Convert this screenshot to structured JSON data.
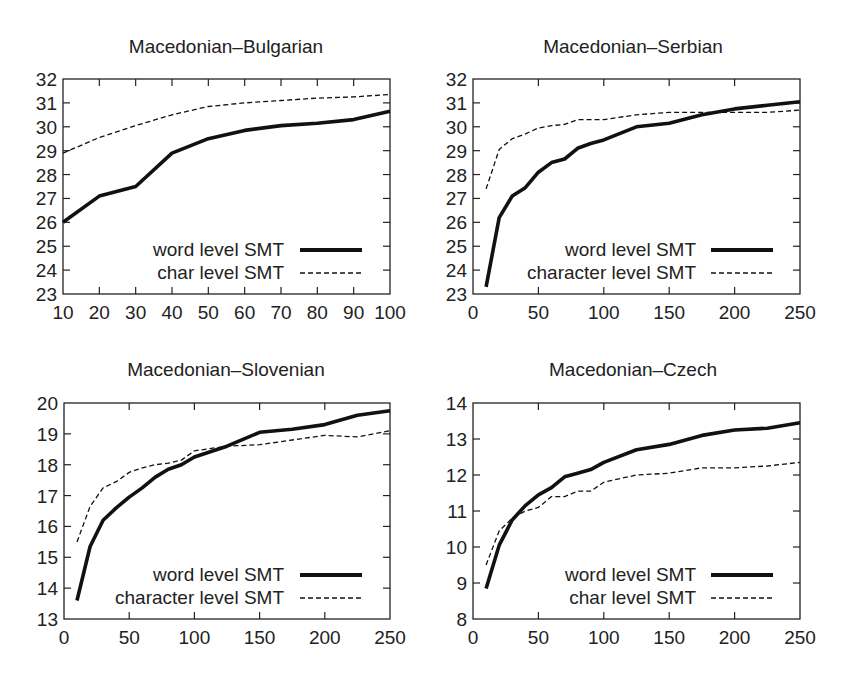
{
  "chart_data": [
    {
      "type": "line",
      "title": "Macedonian–Bulgarian",
      "xlabel": "",
      "ylabel": "",
      "xlim": [
        10,
        100
      ],
      "ylim": [
        23,
        32
      ],
      "xticks": [
        10,
        20,
        30,
        40,
        50,
        60,
        70,
        80,
        90,
        100
      ],
      "yticks": [
        23,
        24,
        25,
        26,
        27,
        28,
        29,
        30,
        31,
        32
      ],
      "grid": false,
      "legend_position": "lower right",
      "series": [
        {
          "name": "word level SMT",
          "style": "solid-thick",
          "x": [
            10,
            20,
            30,
            40,
            50,
            60,
            70,
            80,
            90,
            100
          ],
          "values": [
            26.0,
            27.1,
            27.5,
            28.9,
            29.5,
            29.85,
            30.05,
            30.15,
            30.3,
            30.65
          ]
        },
        {
          "name": "char level SMT",
          "style": "dashed",
          "x": [
            10,
            20,
            30,
            40,
            50,
            60,
            70,
            80,
            90,
            100
          ],
          "values": [
            28.9,
            29.55,
            30.05,
            30.5,
            30.85,
            31.0,
            31.1,
            31.2,
            31.25,
            31.35
          ]
        }
      ]
    },
    {
      "type": "line",
      "title": "Macedonian–Serbian",
      "xlabel": "",
      "ylabel": "",
      "xlim": [
        0,
        250
      ],
      "ylim": [
        23,
        32
      ],
      "xticks": [
        0,
        50,
        100,
        150,
        200,
        250
      ],
      "yticks": [
        23,
        24,
        25,
        26,
        27,
        28,
        29,
        30,
        31,
        32
      ],
      "grid": false,
      "legend_position": "lower right",
      "series": [
        {
          "name": "word level SMT",
          "style": "solid-thick",
          "x": [
            10,
            20,
            30,
            40,
            50,
            60,
            70,
            80,
            90,
            100,
            125,
            150,
            175,
            200,
            225,
            250
          ],
          "values": [
            23.3,
            26.2,
            27.1,
            27.45,
            28.1,
            28.5,
            28.65,
            29.1,
            29.3,
            29.45,
            30.0,
            30.15,
            30.5,
            30.75,
            30.9,
            31.05
          ]
        },
        {
          "name": "character level SMT",
          "style": "dashed",
          "x": [
            10,
            20,
            30,
            40,
            50,
            60,
            70,
            80,
            90,
            100,
            125,
            150,
            175,
            200,
            225,
            250
          ],
          "values": [
            27.4,
            29.05,
            29.5,
            29.7,
            29.95,
            30.05,
            30.1,
            30.3,
            30.3,
            30.3,
            30.5,
            30.6,
            30.6,
            30.6,
            30.6,
            30.7
          ]
        }
      ]
    },
    {
      "type": "line",
      "title": "Macedonian–Slovenian",
      "xlabel": "",
      "ylabel": "",
      "xlim": [
        0,
        250
      ],
      "ylim": [
        13,
        20
      ],
      "xticks": [
        0,
        50,
        100,
        150,
        200,
        250
      ],
      "yticks": [
        13,
        14,
        15,
        16,
        17,
        18,
        19,
        20
      ],
      "grid": false,
      "legend_position": "lower right",
      "series": [
        {
          "name": "word level SMT",
          "style": "solid-thick",
          "x": [
            10,
            20,
            30,
            40,
            50,
            60,
            70,
            80,
            90,
            100,
            125,
            150,
            175,
            200,
            225,
            250
          ],
          "values": [
            13.6,
            15.35,
            16.2,
            16.6,
            16.95,
            17.25,
            17.6,
            17.85,
            18.0,
            18.25,
            18.6,
            19.05,
            19.15,
            19.3,
            19.6,
            19.75
          ]
        },
        {
          "name": "character level SMT",
          "style": "dashed",
          "x": [
            10,
            20,
            30,
            40,
            50,
            60,
            70,
            80,
            90,
            100,
            125,
            150,
            175,
            200,
            225,
            250
          ],
          "values": [
            15.5,
            16.65,
            17.25,
            17.45,
            17.75,
            17.9,
            18.0,
            18.05,
            18.15,
            18.45,
            18.6,
            18.65,
            18.8,
            18.95,
            18.9,
            19.1
          ]
        }
      ]
    },
    {
      "type": "line",
      "title": "Macedonian–Czech",
      "xlabel": "",
      "ylabel": "",
      "xlim": [
        0,
        250
      ],
      "ylim": [
        8,
        14
      ],
      "xticks": [
        0,
        50,
        100,
        150,
        200,
        250
      ],
      "yticks": [
        8,
        9,
        10,
        11,
        12,
        13,
        14
      ],
      "grid": false,
      "legend_position": "lower right",
      "series": [
        {
          "name": "word level SMT",
          "style": "solid-thick",
          "x": [
            10,
            20,
            30,
            40,
            50,
            60,
            70,
            80,
            90,
            100,
            125,
            150,
            175,
            200,
            225,
            250
          ],
          "values": [
            8.85,
            10.05,
            10.75,
            11.15,
            11.45,
            11.65,
            11.95,
            12.05,
            12.15,
            12.35,
            12.7,
            12.85,
            13.1,
            13.25,
            13.3,
            13.45
          ]
        },
        {
          "name": "char level SMT",
          "style": "dashed",
          "x": [
            10,
            20,
            30,
            40,
            50,
            60,
            70,
            80,
            90,
            100,
            125,
            150,
            175,
            200,
            225,
            250
          ],
          "values": [
            9.5,
            10.45,
            10.8,
            11.0,
            11.1,
            11.4,
            11.4,
            11.55,
            11.55,
            11.8,
            12.0,
            12.05,
            12.2,
            12.2,
            12.25,
            12.35
          ]
        }
      ]
    }
  ],
  "panels": [
    {
      "title": "Macedonian–Bulgarian",
      "legend": {
        "word": "word level SMT",
        "char": "char level SMT"
      }
    },
    {
      "title": "Macedonian–Serbian",
      "legend": {
        "word": "word level SMT",
        "char": "character level SMT"
      }
    },
    {
      "title": "Macedonian–Slovenian",
      "legend": {
        "word": "word level SMT",
        "char": "character level SMT"
      }
    },
    {
      "title": "Macedonian–Czech",
      "legend": {
        "word": "word level SMT",
        "char": "char level SMT"
      }
    }
  ],
  "colors": {
    "line": "#111111",
    "frame": "#222222",
    "text": "#222222",
    "background": "#ffffff"
  }
}
